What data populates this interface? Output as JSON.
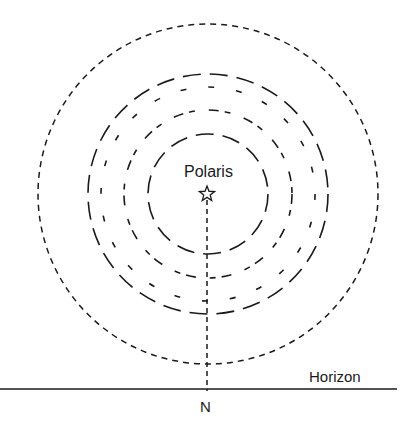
{
  "diagram": {
    "labels": {
      "star": "Polaris",
      "horizon": "Horizon",
      "direction": "N"
    },
    "center": {
      "x": 208,
      "y": 194
    },
    "colors": {
      "stroke": "#1a1a1a",
      "background": "#ffffff"
    },
    "circles": [
      {
        "name": "outer-circle",
        "r": 170,
        "dash": "6 5",
        "width": 1.5
      },
      {
        "name": "trail-circle-1",
        "r": 120,
        "dash": "18 9",
        "width": 1.6
      },
      {
        "name": "trail-circle-2",
        "r": 107,
        "dash": "6 22",
        "width": 1.6
      },
      {
        "name": "trail-circle-3",
        "r": 84,
        "dash": "10 6 6 14",
        "width": 1.6
      },
      {
        "name": "trail-circle-4",
        "r": 60,
        "dash": "18 9",
        "width": 1.6
      }
    ],
    "horizon_line": {
      "x1": 0,
      "x2": 397,
      "y": 389
    },
    "meridian_line": {
      "x": 207,
      "y1": 200,
      "y2": 391,
      "dash": "5 4"
    },
    "star_icon": "☆"
  }
}
